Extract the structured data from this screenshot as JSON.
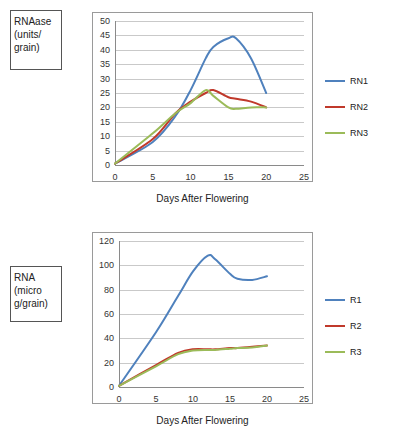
{
  "charts": [
    {
      "id": "top",
      "ycaption": "RNAase (units/ grain)",
      "xlabel": "Days After Flowering",
      "legend": [
        {
          "label": "RN1",
          "color": "#4f81bd"
        },
        {
          "label": "RN2",
          "color": "#c0392b"
        },
        {
          "label": "RN3",
          "color": "#9bbb59"
        }
      ],
      "chart_data": {
        "type": "line",
        "title": "",
        "xlabel": "Days After Flowering",
        "ylabel": "RNAase (units/grain)",
        "xlim": [
          0,
          25
        ],
        "ylim": [
          0,
          50
        ],
        "xticks": [
          0,
          5,
          10,
          15,
          20,
          25
        ],
        "yticks": [
          0,
          5,
          10,
          15,
          20,
          25,
          30,
          35,
          40,
          45,
          50
        ],
        "grid": true,
        "legend_position": "right",
        "x": [
          0,
          5,
          8,
          10,
          12,
          13,
          15,
          16,
          18,
          20
        ],
        "series": [
          {
            "name": "RN1",
            "color": "#4f81bd",
            "values": [
              0.5,
              8,
              17,
              26,
              37,
              41,
              44,
              44,
              37,
              25
            ]
          },
          {
            "name": "RN2",
            "color": "#c0392b",
            "values": [
              0.5,
              9,
              18,
              22,
              25,
              26,
              23.5,
              23,
              22,
              20
            ]
          },
          {
            "name": "RN3",
            "color": "#9bbb59",
            "values": [
              0.5,
              11,
              18,
              21.5,
              26,
              24,
              20,
              19.5,
              20,
              20
            ]
          }
        ]
      }
    },
    {
      "id": "bottom",
      "ycaption": "RNA (micro g/grain)",
      "xlabel": "Days After Flowering",
      "legend": [
        {
          "label": "R1",
          "color": "#4f81bd"
        },
        {
          "label": "R2",
          "color": "#c0392b"
        },
        {
          "label": "R3",
          "color": "#9bbb59"
        }
      ],
      "chart_data": {
        "type": "line",
        "title": "",
        "xlabel": "Days After Flowering",
        "ylabel": "RNA (micro g/grain)",
        "xlim": [
          0,
          25
        ],
        "ylim": [
          0,
          120
        ],
        "xticks": [
          0,
          5,
          10,
          15,
          20,
          25
        ],
        "yticks": [
          0,
          20,
          40,
          60,
          80,
          100,
          120
        ],
        "grid": true,
        "legend_position": "right",
        "x": [
          0,
          5,
          8,
          10,
          12,
          13,
          15,
          16,
          18,
          20
        ],
        "series": [
          {
            "name": "R1",
            "color": "#4f81bd",
            "values": [
              1,
              45,
              75,
              95,
              108,
              105,
              93,
              89,
              88,
              91
            ]
          },
          {
            "name": "R2",
            "color": "#c0392b",
            "values": [
              1,
              18,
              28,
              31,
              31,
              31,
              32,
              32,
              33,
              34
            ]
          },
          {
            "name": "R3",
            "color": "#9bbb59",
            "values": [
              1,
              17,
              27,
              30,
              30.5,
              30.5,
              31.5,
              32,
              32.5,
              34
            ]
          }
        ]
      }
    }
  ]
}
